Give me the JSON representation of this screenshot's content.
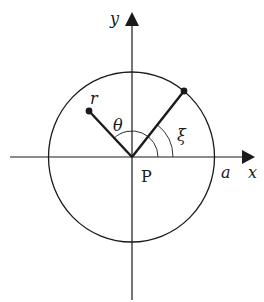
{
  "diagram": {
    "colors": {
      "ink": "#1a1a1a",
      "background": "#ffffff"
    },
    "labels": {
      "y_axis": "y",
      "x_axis": "x",
      "origin": "P",
      "radius": "a",
      "point_r": "r",
      "angle_theta": "θ",
      "angle_xi": "ξ"
    }
  }
}
